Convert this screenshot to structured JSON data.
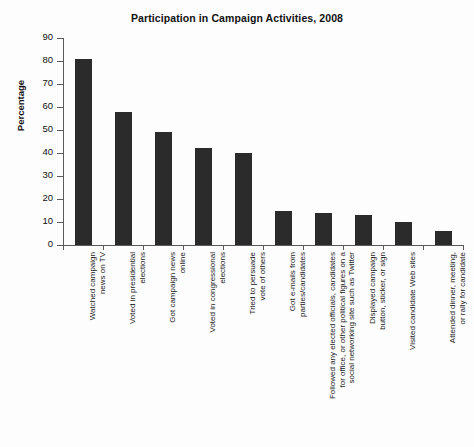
{
  "chart_data": {
    "type": "bar",
    "title": "Participation in Campaign Activities, 2008",
    "xlabel": "",
    "ylabel": "Percentage",
    "ylim": [
      0,
      90
    ],
    "ytick_step": 10,
    "grid": false,
    "legend": null,
    "bar_color": "#2b2b2b",
    "background_color": "#fdfdfd",
    "categories": [
      "Watched campaign\nnews on TV",
      "Voted in presidential\nelections",
      "Got campaign news\nonline",
      "Voted in congressional\nelections",
      "Tried to persuade\nvote of others",
      "Got e-mails from\nparties/candidates",
      "Followed any elected officials, candidates\nfor office, or other political figures on a\nsocial networking site such as Twitter",
      "Displayed campaign\nbutton, sticker, or sign",
      "Visited candidate Web sites",
      "Attended dinner, meeting,\nor rally for candidate"
    ],
    "values": [
      81,
      58,
      49,
      42,
      40,
      15,
      14,
      13,
      10,
      6
    ],
    "ytick_labels": [
      "0",
      "10",
      "20",
      "30",
      "40",
      "50",
      "60",
      "70",
      "80",
      "90"
    ],
    "ytick_values": [
      0,
      10,
      20,
      30,
      40,
      50,
      60,
      70,
      80,
      90
    ]
  }
}
